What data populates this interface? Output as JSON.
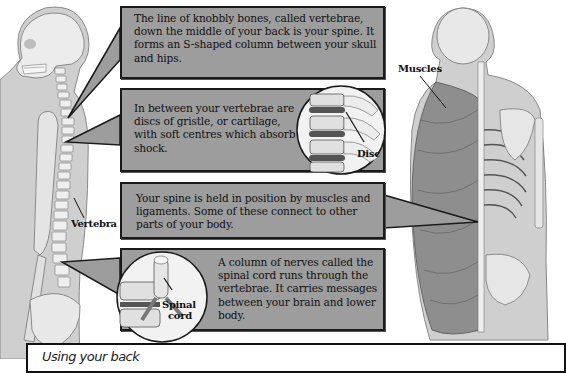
{
  "boxes": [
    {
      "id": "spine",
      "text": "The line of knobbly bones, called vertebrae, down the middle of your back is your spine. It forms an S-shaped column between your skull and hips."
    },
    {
      "id": "discs",
      "text": "In between your vertebrae are discs of gristle, or cartilage, with soft centres which absorb shock."
    },
    {
      "id": "muscles",
      "text": "Your spine is held in position by muscles and ligaments. Some of these connect to other parts of your body."
    },
    {
      "id": "spinal-cord",
      "text": "A column of nerves called the spinal cord runs through the vertebrae. It carries messages between your brain and lower body."
    }
  ],
  "labels": {
    "vertebra": "Vertebra",
    "disc": "Disc",
    "muscles": "Muscles",
    "spinal_cord_line1": "Spinal",
    "spinal_cord_line2": "cord"
  },
  "bottom_panel": {
    "title": "Using your back"
  },
  "colors": {
    "box_fill": "#9d9d9d",
    "box_border": "#1a1a1a",
    "body_gray": "#c8c8c8",
    "bone": "#ececec"
  }
}
